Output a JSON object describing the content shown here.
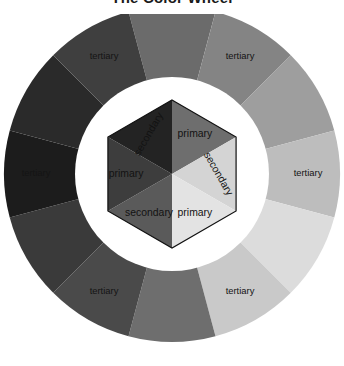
{
  "page": {
    "title": "The Color Wheel",
    "background": "#ffffff"
  },
  "diagram": {
    "name": "color-wheel",
    "center": {
      "x": 172,
      "y": 174
    },
    "outer_radius": 168,
    "ring_inner_radius": 108,
    "gap_radius": 97,
    "hex_radius": 74,
    "ring_gap_color": "#ffffff",
    "outline_color": "#111111",
    "segment_count": 12,
    "outer_ring": [
      {
        "index": 0,
        "label": "",
        "tier": "secondary",
        "color": "#6b6b6b"
      },
      {
        "index": 1,
        "label": "tertiary",
        "tier": "tertiary",
        "color": "#848484"
      },
      {
        "index": 2,
        "label": "",
        "tier": "primary",
        "color": "#9e9e9e"
      },
      {
        "index": 3,
        "label": "tertiary",
        "tier": "tertiary",
        "color": "#bdbdbd"
      },
      {
        "index": 4,
        "label": "",
        "tier": "secondary",
        "color": "#dcdcdc"
      },
      {
        "index": 5,
        "label": "tertiary",
        "tier": "tertiary",
        "color": "#c9c9c9"
      },
      {
        "index": 6,
        "label": "",
        "tier": "primary",
        "color": "#6e6e6e"
      },
      {
        "index": 7,
        "label": "tertiary",
        "tier": "tertiary",
        "color": "#4a4a4a"
      },
      {
        "index": 8,
        "label": "",
        "tier": "secondary",
        "color": "#3a3a3a"
      },
      {
        "index": 9,
        "label": "tertiary",
        "tier": "tertiary",
        "color": "#1c1c1c"
      },
      {
        "index": 10,
        "label": "",
        "tier": "primary",
        "color": "#2a2a2a"
      },
      {
        "index": 11,
        "label": "tertiary",
        "tier": "tertiary",
        "color": "#3f3f3f"
      }
    ],
    "inner_hexagon": [
      {
        "index": 0,
        "label": "primary",
        "color": "#6e6e6e",
        "rotation": 0
      },
      {
        "index": 1,
        "label": "secondary",
        "color": "#d4d4d4",
        "rotation": 60
      },
      {
        "index": 2,
        "label": "primary",
        "color": "#e3e3e3",
        "rotation": 0
      },
      {
        "index": 3,
        "label": "secondary",
        "color": "#5a5a5a",
        "rotation": 0
      },
      {
        "index": 4,
        "label": "primary",
        "color": "#3d3d3d",
        "rotation": 0
      },
      {
        "index": 5,
        "label": "secondary",
        "color": "#232323",
        "rotation": -60
      }
    ],
    "labels": {
      "tertiary": "tertiary",
      "primary": "primary",
      "secondary": "secondary"
    }
  }
}
